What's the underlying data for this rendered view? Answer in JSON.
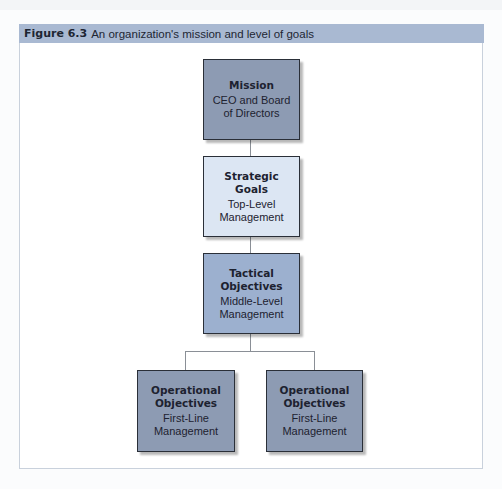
{
  "figure": {
    "number": "Figure 6.3",
    "caption": "An organization's mission and level of goals"
  },
  "colors": {
    "header_band": "#a9b9d2",
    "box_dark": "#8d9bb3",
    "box_light": "#dce6f3",
    "box_tactical": "#9cb0cf",
    "box_border": "#2a2f38"
  },
  "hierarchy": {
    "mission": {
      "title": "Mission",
      "subtitle": "CEO and Board of Directors"
    },
    "strategic": {
      "title": "Strategic Goals",
      "subtitle": "Top-Level Management"
    },
    "tactical": {
      "title": "Tactical Objectives",
      "subtitle": "Middle-Level Management"
    },
    "operational": [
      {
        "title": "Operational Objectives",
        "subtitle": "First-Line Management"
      },
      {
        "title": "Operational Objectives",
        "subtitle": "First-Line Management"
      }
    ]
  }
}
